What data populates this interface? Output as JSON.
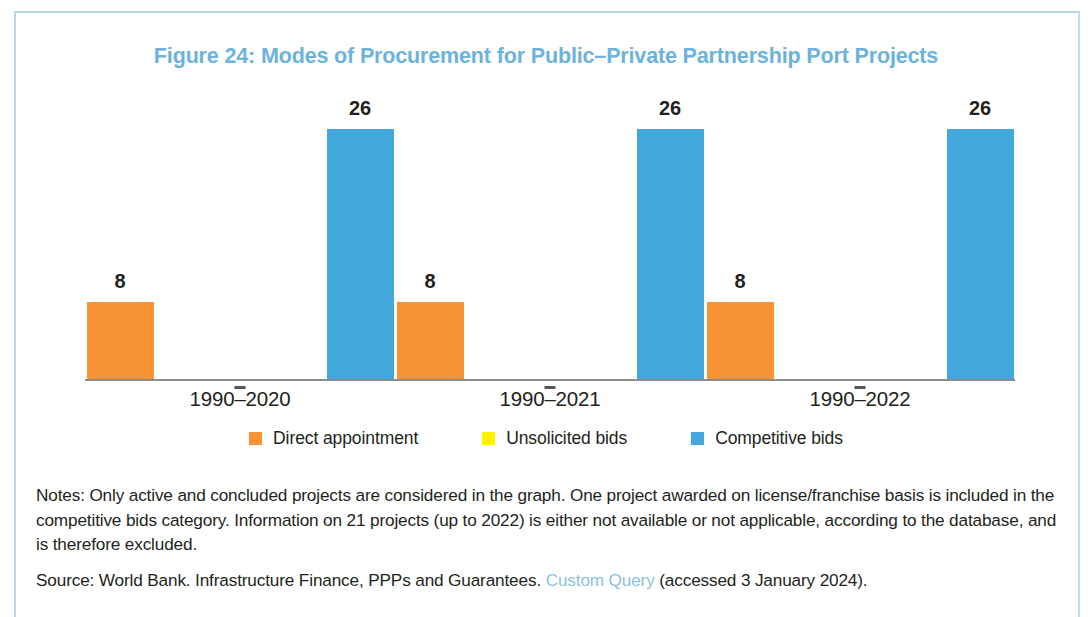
{
  "figure": {
    "title": "Figure 24: Modes of Procurement for Public–Private Partnership Port Projects",
    "title_color": "#6cb2dd",
    "frame_color": "#b9d7e6"
  },
  "legend": {
    "position": "bottom-center",
    "items": [
      {
        "label": "Direct appointment",
        "color": "#f79237"
      },
      {
        "label": "Unsolicited bids",
        "color": "#fff200"
      },
      {
        "label": "Competitive bids",
        "color": "#43a9dc"
      }
    ]
  },
  "footnotes": {
    "notes": "Notes: Only active and concluded projects are considered in the graph. One project awarded on license/franchise basis is included in the competitive bids category. Information on 21 projects (up to 2022) is either not available or not applicable, according to the database, and is therefore excluded.",
    "source_prefix": "Source: World Bank. Infrastructure Finance, PPPs and Guarantees. ",
    "source_link": "Custom Query",
    "source_suffix": " (accessed 3 January 2024)."
  },
  "chart_data": {
    "type": "bar",
    "title": "Figure 24: Modes of Procurement for Public–Private Partnership Port Projects",
    "xlabel": "",
    "ylabel": "",
    "ylim": [
      0,
      30
    ],
    "grid": false,
    "legend_position": "bottom",
    "show_value_labels": true,
    "categories": [
      "1990–2020",
      "1990–2021",
      "1990–2022"
    ],
    "series": [
      {
        "name": "Direct appointment",
        "color": "#f79237",
        "values": [
          8,
          8,
          8
        ]
      },
      {
        "name": "Unsolicited bids",
        "color": "#fff200",
        "values": [
          0,
          0,
          0
        ]
      },
      {
        "name": "Competitive bids",
        "color": "#43a9dc",
        "values": [
          26,
          26,
          26
        ]
      }
    ],
    "value_labels": [
      {
        "category": "1990–2020",
        "series": "Direct appointment",
        "text": "8"
      },
      {
        "category": "1990–2020",
        "series": "Competitive bids",
        "text": "26"
      },
      {
        "category": "1990–2021",
        "series": "Direct appointment",
        "text": "8"
      },
      {
        "category": "1990–2021",
        "series": "Competitive bids",
        "text": "26"
      },
      {
        "category": "1990–2022",
        "series": "Direct appointment",
        "text": "8"
      },
      {
        "category": "1990–2022",
        "series": "Competitive bids",
        "text": "26"
      }
    ]
  }
}
